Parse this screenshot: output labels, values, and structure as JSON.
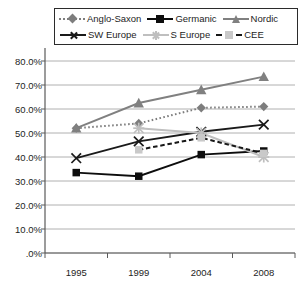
{
  "chart_data": {
    "type": "line",
    "title": "",
    "subtitle": "",
    "xlabel": "",
    "ylabel": "",
    "categories": [
      "1995",
      "1999",
      "2004",
      "2008"
    ],
    "x": [
      1995,
      1999,
      2004,
      2008
    ],
    "ylim": [
      0,
      80
    ],
    "ytick_values": [
      0,
      10,
      20,
      30,
      40,
      50,
      60,
      70,
      80
    ],
    "ytick_labels": [
      ".0%",
      "10.0%",
      "20.0%",
      "30.0%",
      "40.0%",
      "50.0%",
      "60.0%",
      "70.0%",
      "80.0%"
    ],
    "grid": "horizontal",
    "legend_position": "top",
    "value_suffix": "%",
    "series": [
      {
        "name": "Anglo-Saxon",
        "values": [
          52.0,
          54.0,
          60.5,
          61.0
        ],
        "color": "#7d7d7d",
        "line_style": "dotted",
        "marker": "diamond"
      },
      {
        "name": "Germanic",
        "values": [
          33.5,
          32.0,
          41.0,
          42.5
        ],
        "color": "#0d0d0d",
        "line_style": "solid",
        "marker": "square"
      },
      {
        "name": "Nordic",
        "values": [
          52.0,
          62.5,
          68.0,
          73.5
        ],
        "color": "#808080",
        "line_style": "solid",
        "marker": "triangle"
      },
      {
        "name": "SW Europe",
        "values": [
          39.5,
          46.5,
          50.5,
          53.5
        ],
        "color": "#1a1a1a",
        "line_style": "solid",
        "marker": "x"
      },
      {
        "name": "S Europe",
        "values": [
          null,
          52.0,
          50.0,
          40.0
        ],
        "color": "#bfbfbf",
        "line_style": "solid",
        "marker": "star"
      },
      {
        "name": "CEE",
        "values": [
          null,
          43.0,
          48.0,
          41.5
        ],
        "color": "#171717",
        "line_style": "dashed",
        "marker": "square-light"
      }
    ]
  },
  "legend": {
    "rows": [
      [
        {
          "label": "Anglo-Saxon"
        },
        {
          "label": "Germanic"
        },
        {
          "label": "Nordic"
        }
      ],
      [
        {
          "label": "SW Europe"
        },
        {
          "label": "S Europe"
        },
        {
          "label": "CEE"
        }
      ]
    ]
  },
  "colors": {
    "axis": "#5a5a5a",
    "grid": "#b0b0b0",
    "text": "#1d1d1d",
    "legend_border": "#2b2b2b",
    "background": "#ffffff"
  }
}
